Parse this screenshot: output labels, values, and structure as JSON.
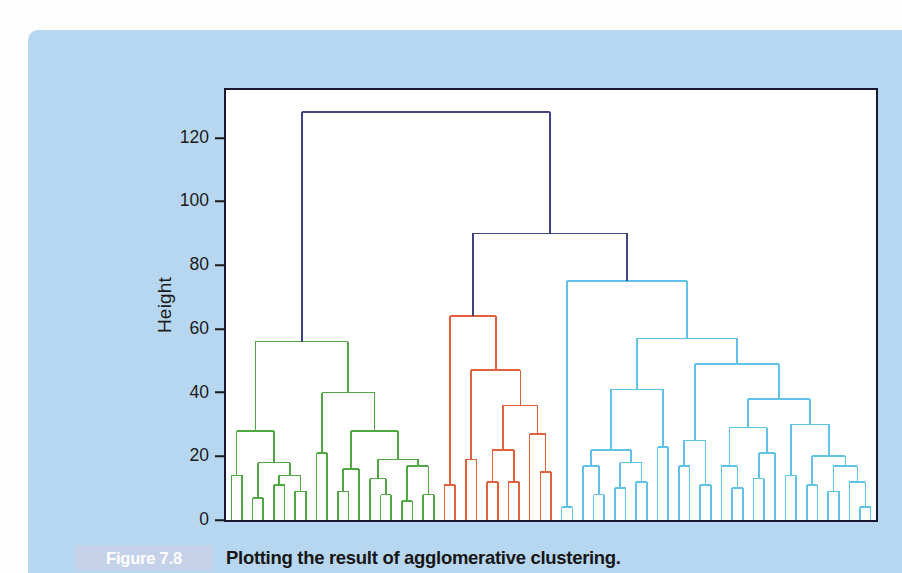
{
  "figure": {
    "label": "Figure 7.8",
    "caption": "Plotting the result of agglomerative clustering."
  },
  "chart_data": {
    "type": "dendrogram",
    "title": "",
    "xlabel": "",
    "ylabel": "Height",
    "yticks": [
      0,
      20,
      40,
      60,
      80,
      100,
      120
    ],
    "ylim": [
      0,
      135
    ],
    "grid": false,
    "legend": "none",
    "leaf_count": 61,
    "root_height": 128,
    "second_merge_height": 90,
    "colors": {
      "cluster1": "#4fa841",
      "cluster2": "#e2613a",
      "cluster3": "#5fc3e7",
      "link_top": "#3f4384",
      "axis": "#1a1a1a",
      "panel_background": "#b7d6ef",
      "badge_background": "#c5d1e9"
    },
    "clusters": [
      {
        "name": "left-cluster",
        "color_key": "cluster1",
        "top_height": 56,
        "leaves": 20
      },
      {
        "name": "middle-cluster",
        "color_key": "cluster2",
        "top_height": 64,
        "leaves": 11
      },
      {
        "name": "right-cluster",
        "color_key": "cluster3",
        "top_height": 75,
        "leaves": 30
      }
    ],
    "tree": {
      "h": 128,
      "col": "link_top",
      "c": [
        {
          "h": 56,
          "col": "cluster1",
          "c": [
            {
              "h": 28,
              "c": [
                {
                  "h": 14,
                  "c": [
                    0,
                    0
                  ]
                },
                {
                  "h": 18,
                  "c": [
                    {
                      "h": 7,
                      "c": [
                        0,
                        0
                      ]
                    },
                    {
                      "h": 14,
                      "c": [
                        {
                          "h": 11,
                          "c": [
                            0,
                            0
                          ]
                        },
                        {
                          "h": 9,
                          "c": [
                            0,
                            0
                          ]
                        }
                      ]
                    }
                  ]
                }
              ]
            },
            {
              "h": 40,
              "c": [
                {
                  "h": 21,
                  "c": [
                    0,
                    0
                  ]
                },
                {
                  "h": 28,
                  "c": [
                    {
                      "h": 16,
                      "c": [
                        {
                          "h": 9,
                          "c": [
                            0,
                            0
                          ]
                        },
                        0
                      ]
                    },
                    {
                      "h": 19,
                      "c": [
                        {
                          "h": 13,
                          "c": [
                            0,
                            {
                              "h": 8,
                              "c": [
                                0,
                                0
                              ]
                            }
                          ]
                        },
                        {
                          "h": 17,
                          "c": [
                            {
                              "h": 6,
                              "c": [
                                0,
                                0
                              ]
                            },
                            {
                              "h": 8,
                              "c": [
                                0,
                                0
                              ]
                            }
                          ]
                        }
                      ]
                    }
                  ]
                }
              ]
            }
          ]
        },
        {
          "h": 90,
          "col": "link_top",
          "c": [
            {
              "h": 64,
              "col": "cluster2",
              "c": [
                {
                  "h": 11,
                  "c": [
                    0,
                    0
                  ]
                },
                {
                  "h": 47,
                  "c": [
                    {
                      "h": 19,
                      "c": [
                        0,
                        0
                      ]
                    },
                    {
                      "h": 36,
                      "c": [
                        {
                          "h": 22,
                          "c": [
                            {
                              "h": 12,
                              "c": [
                                0,
                                0
                              ]
                            },
                            {
                              "h": 12,
                              "c": [
                                0,
                                0
                              ]
                            }
                          ]
                        },
                        {
                          "h": 27,
                          "c": [
                            0,
                            {
                              "h": 15,
                              "c": [
                                0,
                                0
                              ]
                            }
                          ]
                        }
                      ]
                    }
                  ]
                }
              ]
            },
            {
              "h": 75,
              "col": "cluster3",
              "c": [
                {
                  "h": 4,
                  "c": [
                    0,
                    0
                  ]
                },
                {
                  "h": 57,
                  "c": [
                    {
                      "h": 41,
                      "c": [
                        {
                          "h": 22,
                          "c": [
                            {
                              "h": 17,
                              "c": [
                                0,
                                {
                                  "h": 8,
                                  "c": [
                                    0,
                                    0
                                  ]
                                }
                              ]
                            },
                            {
                              "h": 18,
                              "c": [
                                {
                                  "h": 10,
                                  "c": [
                                    0,
                                    0
                                  ]
                                },
                                {
                                  "h": 12,
                                  "c": [
                                    0,
                                    0
                                  ]
                                }
                              ]
                            }
                          ]
                        },
                        {
                          "h": 23,
                          "c": [
                            0,
                            0
                          ]
                        }
                      ]
                    },
                    {
                      "h": 49,
                      "c": [
                        {
                          "h": 25,
                          "c": [
                            {
                              "h": 17,
                              "c": [
                                0,
                                0
                              ]
                            },
                            {
                              "h": 11,
                              "c": [
                                0,
                                0
                              ]
                            }
                          ]
                        },
                        {
                          "h": 38,
                          "c": [
                            {
                              "h": 29,
                              "c": [
                                {
                                  "h": 17,
                                  "c": [
                                    0,
                                    {
                                      "h": 10,
                                      "c": [
                                        0,
                                        0
                                      ]
                                    }
                                  ]
                                },
                                {
                                  "h": 21,
                                  "c": [
                                    {
                                      "h": 13,
                                      "c": [
                                        0,
                                        0
                                      ]
                                    },
                                    0
                                  ]
                                }
                              ]
                            },
                            {
                              "h": 30,
                              "c": [
                                {
                                  "h": 14,
                                  "c": [
                                    0,
                                    0
                                  ]
                                },
                                {
                                  "h": 20,
                                  "c": [
                                    {
                                      "h": 11,
                                      "c": [
                                        0,
                                        0
                                      ]
                                    },
                                    {
                                      "h": 17,
                                      "c": [
                                        {
                                          "h": 9,
                                          "c": [
                                            0,
                                            0
                                          ]
                                        },
                                        {
                                          "h": 12,
                                          "c": [
                                            0,
                                            {
                                              "h": 4,
                                              "c": [
                                                0,
                                                0
                                              ]
                                            }
                                          ]
                                        }
                                      ]
                                    }
                                  ]
                                }
                              ]
                            }
                          ]
                        }
                      ]
                    }
                  ]
                }
              ]
            }
          ]
        }
      ]
    }
  }
}
